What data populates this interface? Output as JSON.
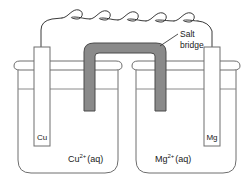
{
  "figure": {
    "type": "electrochemical-cell",
    "background_color": "#ffffff",
    "line_color": "#3a3a3a",
    "salt_bridge_color": "#8a8a8a",
    "salt_bridge_edge_color": "#4a4a4a"
  },
  "callout": {
    "line1": "Salt",
    "line2": "bridge"
  },
  "left_cell": {
    "electrode_label": "Cu",
    "solution_symbol": "Cu",
    "solution_charge": "2+",
    "solution_state": "(aq)"
  },
  "right_cell": {
    "electrode_label": "Mg",
    "solution_symbol": "Mg",
    "solution_charge": "2+",
    "solution_state": "(aq)"
  },
  "wire": {
    "coil_count": 5,
    "description": "coiled-connecting-wire"
  }
}
